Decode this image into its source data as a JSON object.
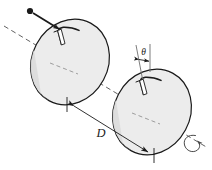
{
  "figure": {
    "kind": "physics-diagram",
    "background_color": "#ffffff",
    "line_color": "#1a1a1a",
    "disk_face_color": "#ececec",
    "disk_rim_color": "#b8b8b8",
    "disk_rim_shadow_color": "#8f8f8f",
    "labels": {
      "separation": "D",
      "angle": "θ"
    },
    "elements": {
      "axis": "dashed-rotation-axis",
      "particle": "incoming-particle-dot",
      "particle_arrow": "incoming-particle-arrow",
      "disk_near": "slotted-disk-near",
      "disk_far": "slotted-disk-far",
      "slot_near": "slot-near",
      "slot_far": "slot-far",
      "dimension": "separation-dimension-line",
      "angle_marker": "angle-theta-marker",
      "rotation": "rotation-direction-arrow"
    },
    "geometry": {
      "axis_start": [
        4,
        26
      ],
      "axis_end": [
        208,
        148
      ],
      "disk_near_center": [
        70,
        62
      ],
      "disk_far_center": [
        152,
        112
      ],
      "disk_rx": 38,
      "disk_ry": 44,
      "disk_tilt_deg": 28,
      "dimension_start": [
        66,
        100
      ],
      "dimension_end": [
        154,
        152
      ]
    }
  }
}
